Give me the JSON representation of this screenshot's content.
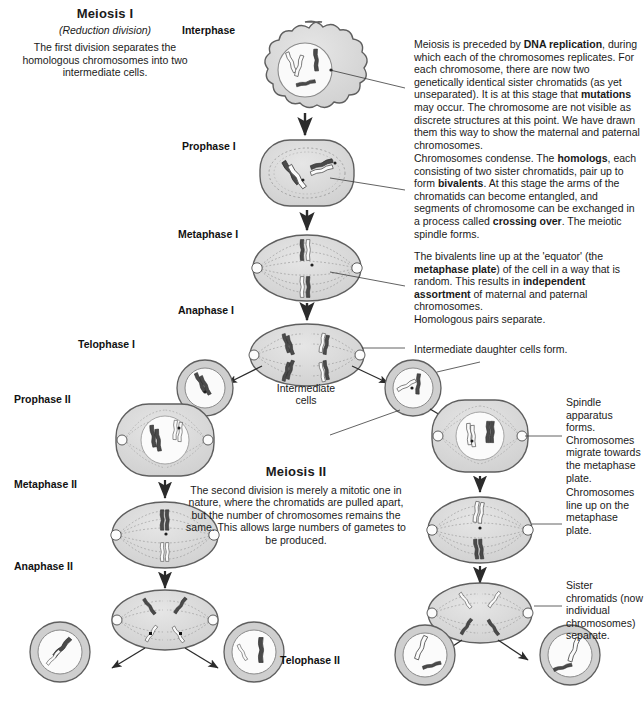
{
  "page": {
    "background": "#ffffff",
    "ink": "#1a1a1a"
  },
  "meiosis_one": {
    "title": "Meiosis I",
    "subtitle": "(Reduction division)",
    "body": "The first division separates the homologous chromosomes into two intermediate cells."
  },
  "meiosis_two": {
    "title": "Meiosis II",
    "body": "The second division is merely a mitotic one in nature, where the chromatids are pulled apart, but the number of chromosomes remains the same. This allows large numbers of gametes to be produced."
  },
  "phase_labels": {
    "interphase": "Interphase",
    "prophase_i": "Prophase I",
    "metaphase_i": "Metaphase I",
    "anaphase_i": "Anaphase I",
    "telophase_i": "Telophase I",
    "prophase_ii": "Prophase II",
    "metaphase_ii": "Metaphase II",
    "anaphase_ii": "Anaphase II",
    "telophase_ii": "Telophase II"
  },
  "annotations": {
    "intermediate_cells": "Intermediate\ncells",
    "interphase_note_1": "Meiosis is preceded by ",
    "interphase_note_b1": "DNA replication",
    "interphase_note_2": ", during which each of the chromosomes replicates. For each chromosome, there are now two genetically identical sister chromatids (as yet unseparated). It is at this stage that ",
    "interphase_note_b2": "mutations",
    "interphase_note_3": " may occur. The chromosome are not visible as discrete structures at this point. We have drawn them this way to show the maternal and paternal chromosomes.",
    "prophase_note_1": "Chromosomes condense. The ",
    "prophase_note_b1": "homologs",
    "prophase_note_2": ", each consisting of two sister chromatids, pair up to form ",
    "prophase_note_b2": "bivalents",
    "prophase_note_3": ". At this stage the arms of the chromatids can become entangled, and segments of chromosome can be exchanged in a process called ",
    "prophase_note_b3": "crossing over",
    "prophase_note_4": ". The meiotic spindle forms.",
    "metaphase_note_1": "The bivalents line up at the 'equator' (the ",
    "metaphase_note_b1": "metaphase plate",
    "metaphase_note_2": ") of the cell in a way that is random. This results in ",
    "metaphase_note_b2": "independent assortment",
    "metaphase_note_3": " of maternal and paternal chromosomes.",
    "homologous_pairs": "Homologous pairs separate.",
    "intermediate_daughter": "Intermediate daughter cells form.",
    "spindle_apparatus": "Spindle apparatus forms. Chromosomes migrate towards the metaphase plate.",
    "chromosomes_line_up": "Chromosomes line up on the metaphase plate.",
    "sister_chromatids": "Sister chromatids (now individual chromosomes) separate."
  },
  "colors": {
    "cell_membrane": "#6e6e6e",
    "cytoplasm": "#d9d9d9",
    "nucleus": "#f7f7f7",
    "chromosome_dark": "#3b3b3b",
    "chromosome_light": "#ffffff",
    "spindle": "#8c8c8c",
    "arrow": "#2b2b2b"
  }
}
